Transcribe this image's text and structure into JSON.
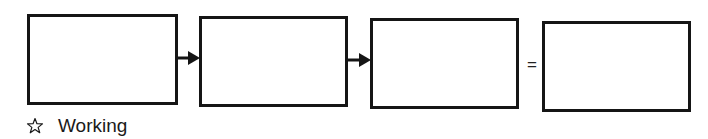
{
  "diagram": {
    "type": "flow",
    "boxes": [
      {
        "id": "box1",
        "label": ""
      },
      {
        "id": "box2",
        "label": ""
      },
      {
        "id": "box3",
        "label": ""
      },
      {
        "id": "box4",
        "label": ""
      }
    ],
    "connectors": [
      {
        "from": "box1",
        "to": "box2",
        "kind": "arrow"
      },
      {
        "from": "box2",
        "to": "box3",
        "kind": "arrow"
      },
      {
        "from": "box3",
        "to": "box4",
        "kind": "equals"
      }
    ],
    "equals_symbol": "=",
    "colors": {
      "stroke": "#151515",
      "fill": "#ffffff"
    }
  },
  "legend": {
    "icon": "star-outline-icon",
    "label": "Working"
  }
}
